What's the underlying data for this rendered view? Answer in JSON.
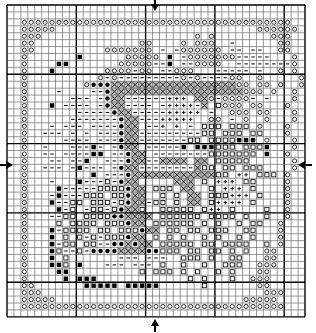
{
  "grid": {
    "cols": 43,
    "rows": 45,
    "cell_px": 6.93,
    "major_every": 10,
    "line_color": "#000000",
    "minor_color": "#555555"
  },
  "legend_symbols": {
    "o": "circle",
    "-": "dash",
    "#": "filled-square",
    "x": "cross-hatch",
    "*": "filled-dot",
    "+": "plus",
    "s": "open-square",
    ".": "empty"
  },
  "center_markers": {
    "top_arrow_col": 21,
    "bottom_arrow_col": 21,
    "left_arrow_row": 23,
    "right_arrow_row": 23
  },
  "rows": [
    "...........................................",
    "...........................................",
    "..ooooooooooooooooooooooooooooooooooooooo..",
    "..ooooo.............................oooooo.",
    "..ooo......................o.o........ooo.",
    "..oo...............oo....o.ooo..-......oo.",
    "..oo..........ooooooo.-.-oooooo.--.--..oo.",
    "..o.......#......ooooo.#.-ooooooo-----...o",
    "..o....##.......ooooo--#.--oooo..--------o",
    "..o...#.......oooo-oo.--ooo...-----.-..o.o",
    "..o..........o-o---------o-o----oo..o.....o",
    "..o........o***xxxxxxxxxxxxxxxxxxoo.oo.o..o",
    "..o....-....--*xxxxxxxxxxxxxxxxxxxooo.o..o",
    "..o......---.-*xx------+++.xxo-oooo-.-...o",
    "..o...#.----.-*xx----.-++++-x.sooo.oo...o",
    "..o.......-----*xx-----+++++.-..ooo.oo...o",
    "..o......-------*xx---+++++..oo.-.o..o...o",
    "..o...-.---.----*xx.--+.+.-.sss.sss.o...o",
    "..o..---.-.-.---*xx---------ss.sss.ss...o",
    "..o.....----.---*xx-------ss.ssss###.o...o",
    "..o..-...---#-.-*xx.-----#.###sss.sss#...o",
    "..o..--.----##.--*xx.--------sssssss.#..o",
    "..o...--.--#..---*xx--xxxx.xx.sssss......o",
    "..o..---.-#---.-*xx--------xss.ss.sss....o",
    "..o.........#.---*xxxxxxxxxxxxss.++.sss.o",
    "..o...-...#---s-*xx.....xxx.s.+++.ss....o",
    "..o....#-----ssss*xx.sss.xx..s.+++.s....o",
    "..o...-#---sss.ss*xx..s.s.xx.sss+++.s...o",
    "..o...#--ss.sss-s*xx-ss.s.xx.s++++.s....o",
    "..o....#-s.-ss-s*xxs..sssss.s++.s....s..o",
    "..o...--ss.ssss**xxxx.ssssss.ssss.s..s..o",
    "..o....s.ssss.sss*xx.ssssss.s.s..s.ss..o",
    "..o...#-ssss.ss.sss*xx.ss.ss.sss..ss...o",
    "..o...#.s.s-s-sss*xx.s.s.s..s.s..s.s...o",
    "..o...#-ss.ss--**x*xx.sssss.ss.ssss..s.o",
    "..o...#s--s-****xxxx**sss.ss.ss.s.s..oo",
    "..o...#.s.......---.---..sss.s..ss...oo",
    "..o...##s.#...---.---.s..s..s..sss..ooo",
    "..o....##..........s.sss.s.s..s.s...oo",
    "..o.....#.###.............s.s...s..ooo",
    "..oo.......#####.#####......s.......oo.",
    "..ooo................................ooo.",
    "..ooooo...........................ooooo..",
    "..oooooooooooooooooooooooooooooooooooooo..",
    "..........................................."
  ]
}
